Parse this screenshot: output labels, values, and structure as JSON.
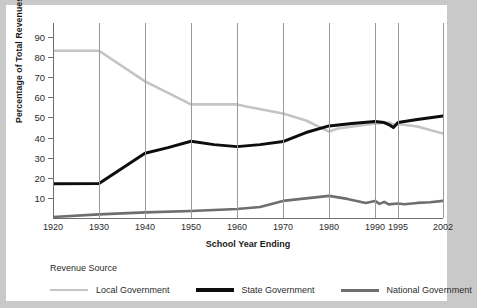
{
  "chart_data": {
    "type": "line",
    "title": "",
    "xlabel": "School Year Ending",
    "ylabel": "Percentage of Total Revenues",
    "categories": [
      "1920",
      "1930",
      "1940",
      "1950",
      "1960",
      "1970",
      "1980",
      "1990",
      "1995",
      "2002"
    ],
    "xtick_labels": [
      "1920",
      "1930",
      "1940",
      "1950",
      "1960",
      "1970",
      "1980",
      "1990",
      "1995",
      "2002"
    ],
    "ytick_labels": [
      "10",
      "20",
      "30",
      "40",
      "50",
      "60",
      "70",
      "80",
      "90"
    ],
    "ylim": [
      0,
      97
    ],
    "xlim": [
      1920,
      2002
    ],
    "grid": false,
    "legend_title": "Revenue Source",
    "legend_position": "bottom",
    "series": [
      {
        "name": "Local Government",
        "color": "#c4c4c4",
        "width": 2.6,
        "points": [
          [
            1920,
            83.2
          ],
          [
            1930,
            83.2
          ],
          [
            1940,
            68.0
          ],
          [
            1950,
            56.5
          ],
          [
            1960,
            56.5
          ],
          [
            1962,
            55.5
          ],
          [
            1970,
            52.0
          ],
          [
            1975,
            48.5
          ],
          [
            1980,
            43.0
          ],
          [
            1982,
            44.5
          ],
          [
            1990,
            47.0
          ],
          [
            1993,
            47.5
          ],
          [
            1994,
            46.5
          ],
          [
            1995,
            46.8
          ],
          [
            1998,
            45.5
          ],
          [
            2002,
            42.0
          ]
        ],
        "values_at_categories": [
          83.2,
          83.2,
          68.0,
          56.5,
          56.5,
          52.0,
          43.0,
          47.0,
          46.8,
          42.0
        ]
      },
      {
        "name": "State Government",
        "color": "#0d0d0d",
        "width": 3.0,
        "points": [
          [
            1920,
            17.0
          ],
          [
            1930,
            17.2
          ],
          [
            1940,
            32.2
          ],
          [
            1945,
            35.0
          ],
          [
            1950,
            38.2
          ],
          [
            1955,
            36.5
          ],
          [
            1960,
            35.5
          ],
          [
            1965,
            36.5
          ],
          [
            1970,
            38.0
          ],
          [
            1975,
            42.5
          ],
          [
            1980,
            45.8
          ],
          [
            1985,
            47.0
          ],
          [
            1990,
            48.0
          ],
          [
            1992,
            47.5
          ],
          [
            1993,
            46.5
          ],
          [
            1994,
            45.0
          ],
          [
            1995,
            47.5
          ],
          [
            1998,
            49.0
          ],
          [
            2002,
            50.8
          ]
        ],
        "values_at_categories": [
          17.0,
          17.2,
          32.2,
          38.2,
          35.5,
          38.0,
          45.8,
          48.0,
          47.5,
          50.8
        ]
      },
      {
        "name": "National Government",
        "color": "#6e6e6e",
        "width": 2.6,
        "points": [
          [
            1920,
            0.5
          ],
          [
            1930,
            1.8
          ],
          [
            1940,
            2.8
          ],
          [
            1950,
            3.5
          ],
          [
            1960,
            4.5
          ],
          [
            1965,
            5.5
          ],
          [
            1970,
            8.5
          ],
          [
            1974,
            9.5
          ],
          [
            1978,
            10.5
          ],
          [
            1980,
            11.0
          ],
          [
            1984,
            9.5
          ],
          [
            1988,
            7.5
          ],
          [
            1990,
            8.5
          ],
          [
            1991,
            7.0
          ],
          [
            1992,
            8.0
          ],
          [
            1993,
            6.8
          ],
          [
            1995,
            7.2
          ],
          [
            1996,
            6.8
          ],
          [
            1998,
            7.5
          ],
          [
            2000,
            7.8
          ],
          [
            2002,
            8.5
          ]
        ],
        "values_at_categories": [
          0.5,
          1.8,
          2.8,
          3.5,
          4.5,
          8.5,
          11.0,
          8.5,
          7.2,
          8.5
        ]
      }
    ]
  },
  "axes": {
    "y_title": "Percentage of Total Revenues",
    "x_title": "School Year Ending"
  },
  "legend": {
    "title": "Revenue Source",
    "items": [
      {
        "label": "Local Government",
        "color": "#c4c4c4",
        "thickness": "2.5px"
      },
      {
        "label": "State Government",
        "color": "#0d0d0d",
        "thickness": "3.5px"
      },
      {
        "label": "National Government",
        "color": "#6e6e6e",
        "thickness": "3px"
      }
    ]
  },
  "colors": {
    "page_background": "#c9c9c9",
    "figure_background": "#ffffff",
    "axis": "#6f6f6f",
    "text": "#2b2b2b"
  }
}
